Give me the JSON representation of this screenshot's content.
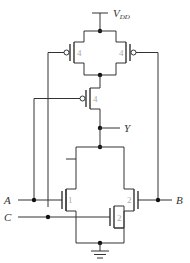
{
  "diagram": {
    "type": "CMOS transistor-level schematic",
    "supply": {
      "label_main": "V",
      "label_sub": "DD"
    },
    "output": {
      "label": "Y"
    },
    "inputs": [
      {
        "label": "A"
      },
      {
        "label": "B"
      },
      {
        "label": "C"
      }
    ],
    "pmos": [
      {
        "name": "pmos-top-left",
        "gate": "C",
        "size": "4"
      },
      {
        "name": "pmos-top-right",
        "gate": "B",
        "size": "4"
      },
      {
        "name": "pmos-middle",
        "gate": "A",
        "size": "4"
      }
    ],
    "nmos": [
      {
        "name": "nmos-left",
        "gate": "A",
        "size": "1"
      },
      {
        "name": "nmos-right",
        "gate": "B",
        "size": "2"
      },
      {
        "name": "nmos-bottom",
        "gate": "C",
        "size": "2"
      }
    ],
    "ground": {
      "symbol": "ground"
    }
  }
}
